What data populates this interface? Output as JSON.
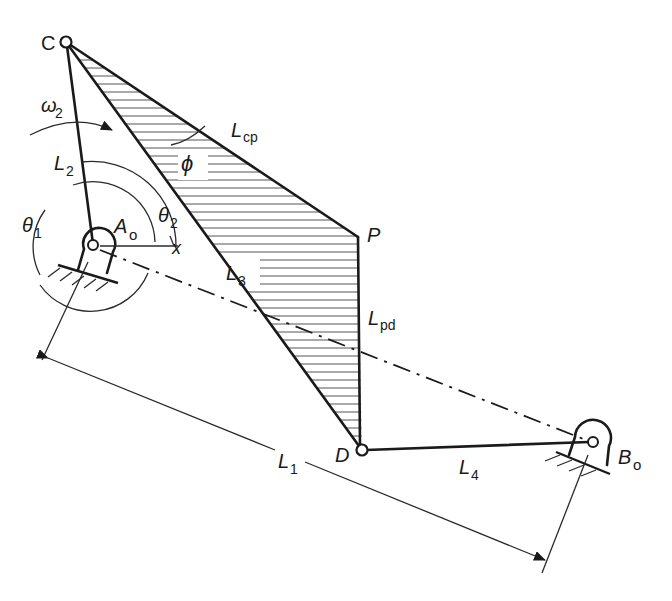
{
  "figure": {
    "type": "four-bar linkage with coupler triangle",
    "colors": {
      "ink": "#1a1a1a",
      "hatch": "#555555",
      "background": "#ffffff"
    }
  },
  "points": {
    "C": {
      "label": "C",
      "x": 66,
      "y": 42
    },
    "A0": {
      "label": "A",
      "sub": "o",
      "x": 93,
      "y": 245
    },
    "P": {
      "label": "P",
      "x": 358,
      "y": 237
    },
    "D": {
      "label": "D",
      "x": 362,
      "y": 450
    },
    "B0": {
      "label": "B",
      "sub": "o",
      "x": 593,
      "y": 442
    }
  },
  "links": {
    "L1": {
      "label": "L",
      "sub": "1",
      "desc": "ground link A0-B0"
    },
    "L2": {
      "label": "L",
      "sub": "2",
      "desc": "crank A0-C"
    },
    "L3": {
      "label": "L",
      "sub": "3",
      "desc": "coupler C-D"
    },
    "L4": {
      "label": "L",
      "sub": "4",
      "desc": "rocker D-B0"
    },
    "Lcp": {
      "label": "L",
      "sub": "cp",
      "desc": "coupler side C-P"
    },
    "Lpd": {
      "label": "L",
      "sub": "pd",
      "desc": "coupler side P-D"
    }
  },
  "angles": {
    "omega2": {
      "label": "ω",
      "sub": "2"
    },
    "theta1": {
      "label": "θ",
      "sub": "1"
    },
    "theta2": {
      "label": "θ",
      "sub": "2"
    },
    "phi": {
      "label": "ϕ"
    },
    "x_axis": {
      "label": "x"
    }
  }
}
